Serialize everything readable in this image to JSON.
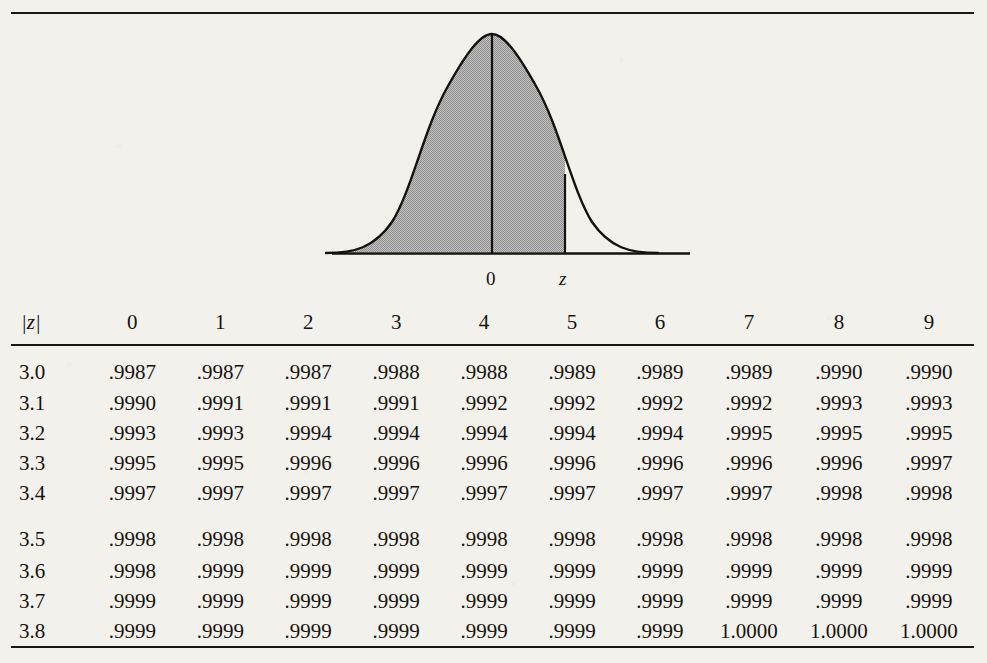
{
  "figure": {
    "name": "standard-normal-curve",
    "center_label": "0",
    "z_label": "z",
    "shading_color": "#b4b4b4",
    "line_color": "#16130f"
  },
  "table": {
    "corner_header": "|z|",
    "column_headers": [
      "0",
      "1",
      "2",
      "3",
      "4",
      "5",
      "6",
      "7",
      "8",
      "9"
    ],
    "rows": [
      {
        "z": "3.0",
        "values": [
          ".9987",
          ".9987",
          ".9987",
          ".9988",
          ".9988",
          ".9989",
          ".9989",
          ".9989",
          ".9990",
          ".9990"
        ]
      },
      {
        "z": "3.1",
        "values": [
          ".9990",
          ".9991",
          ".9991",
          ".9991",
          ".9992",
          ".9992",
          ".9992",
          ".9992",
          ".9993",
          ".9993"
        ]
      },
      {
        "z": "3.2",
        "values": [
          ".9993",
          ".9993",
          ".9994",
          ".9994",
          ".9994",
          ".9994",
          ".9994",
          ".9995",
          ".9995",
          ".9995"
        ]
      },
      {
        "z": "3.3",
        "values": [
          ".9995",
          ".9995",
          ".9996",
          ".9996",
          ".9996",
          ".9996",
          ".9996",
          ".9996",
          ".9996",
          ".9997"
        ]
      },
      {
        "z": "3.4",
        "values": [
          ".9997",
          ".9997",
          ".9997",
          ".9997",
          ".9997",
          ".9997",
          ".9997",
          ".9997",
          ".9998",
          ".9998"
        ]
      },
      {
        "z": "3.5",
        "values": [
          ".9998",
          ".9998",
          ".9998",
          ".9998",
          ".9998",
          ".9998",
          ".9998",
          ".9998",
          ".9998",
          ".9998"
        ]
      },
      {
        "z": "3.6",
        "values": [
          ".9998",
          ".9999",
          ".9999",
          ".9999",
          ".9999",
          ".9999",
          ".9999",
          ".9999",
          ".9999",
          ".9999"
        ]
      },
      {
        "z": "3.7",
        "values": [
          ".9999",
          ".9999",
          ".9999",
          ".9999",
          ".9999",
          ".9999",
          ".9999",
          ".9999",
          ".9999",
          ".9999"
        ]
      },
      {
        "z": "3.8",
        "values": [
          ".9999",
          ".9999",
          ".9999",
          ".9999",
          ".9999",
          ".9999",
          ".9999",
          "1.0000",
          "1.0000",
          "1.0000"
        ]
      }
    ],
    "group_break_after_row_index": 4
  },
  "chart_data": {
    "type": "table",
    "xlabel": "|z|",
    "ylabel": "cumulative probability",
    "categories": [
      "0",
      "1",
      "2",
      "3",
      "4",
      "5",
      "6",
      "7",
      "8",
      "9"
    ],
    "series": [
      {
        "name": "3.0",
        "values": [
          0.9987,
          0.9987,
          0.9987,
          0.9988,
          0.9988,
          0.9989,
          0.9989,
          0.9989,
          0.999,
          0.999
        ]
      },
      {
        "name": "3.1",
        "values": [
          0.999,
          0.9991,
          0.9991,
          0.9991,
          0.9992,
          0.9992,
          0.9992,
          0.9992,
          0.9993,
          0.9993
        ]
      },
      {
        "name": "3.2",
        "values": [
          0.9993,
          0.9993,
          0.9994,
          0.9994,
          0.9994,
          0.9994,
          0.9994,
          0.9995,
          0.9995,
          0.9995
        ]
      },
      {
        "name": "3.3",
        "values": [
          0.9995,
          0.9995,
          0.9996,
          0.9996,
          0.9996,
          0.9996,
          0.9996,
          0.9996,
          0.9996,
          0.9997
        ]
      },
      {
        "name": "3.4",
        "values": [
          0.9997,
          0.9997,
          0.9997,
          0.9997,
          0.9997,
          0.9997,
          0.9997,
          0.9997,
          0.9998,
          0.9998
        ]
      },
      {
        "name": "3.5",
        "values": [
          0.9998,
          0.9998,
          0.9998,
          0.9998,
          0.9998,
          0.9998,
          0.9998,
          0.9998,
          0.9998,
          0.9998
        ]
      },
      {
        "name": "3.6",
        "values": [
          0.9998,
          0.9999,
          0.9999,
          0.9999,
          0.9999,
          0.9999,
          0.9999,
          0.9999,
          0.9999,
          0.9999
        ]
      },
      {
        "name": "3.7",
        "values": [
          0.9999,
          0.9999,
          0.9999,
          0.9999,
          0.9999,
          0.9999,
          0.9999,
          0.9999,
          0.9999,
          0.9999
        ]
      },
      {
        "name": "3.8",
        "values": [
          0.9999,
          0.9999,
          0.9999,
          0.9999,
          0.9999,
          0.9999,
          0.9999,
          1.0,
          1.0,
          1.0
        ]
      }
    ],
    "annotations": [
      "0",
      "z"
    ],
    "grid": false,
    "legend": "none"
  }
}
